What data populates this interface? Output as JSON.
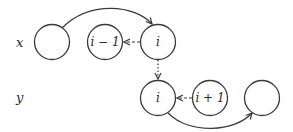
{
  "diagram": {
    "rows": [
      {
        "label": "x",
        "y": 42
      },
      {
        "label": "y",
        "y": 98
      }
    ],
    "nodes": [
      {
        "id": "x0",
        "row": "x",
        "label": "",
        "cx": 52,
        "cy": 42
      },
      {
        "id": "x_im1",
        "row": "x",
        "label": "i − 1",
        "cx": 105,
        "cy": 42
      },
      {
        "id": "x_i",
        "row": "x",
        "label": "i",
        "cx": 158,
        "cy": 42
      },
      {
        "id": "y_i",
        "row": "y",
        "label": "i",
        "cx": 158,
        "cy": 98
      },
      {
        "id": "y_ip1",
        "row": "y",
        "label": "i + 1",
        "cx": 210,
        "cy": 98
      },
      {
        "id": "y_last",
        "row": "y",
        "label": "",
        "cx": 262,
        "cy": 98
      }
    ],
    "edges": [
      {
        "from": "x0",
        "to": "x_i",
        "style": "solid",
        "shape": "arc-over"
      },
      {
        "from": "x_i",
        "to": "x_im1",
        "style": "dashed"
      },
      {
        "from": "x_i",
        "to": "y_i",
        "style": "dotted"
      },
      {
        "from": "y_ip1",
        "to": "y_i",
        "style": "dashed"
      },
      {
        "from": "y_i",
        "to": "y_last",
        "style": "solid",
        "shape": "arc-under"
      }
    ],
    "colors": {
      "stroke": "#3a3a3a",
      "background": "#ffffff"
    }
  }
}
